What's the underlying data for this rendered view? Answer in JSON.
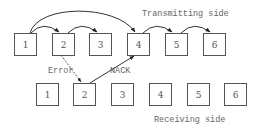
{
  "diagram": {
    "transmitting_label": "Transmitting side",
    "receiving_label": "Receiving side",
    "error_label": "Error",
    "nack_label": "NACK",
    "transmit_packets": [
      "1",
      "2",
      "3",
      "4",
      "5",
      "6"
    ],
    "receive_packets": [
      "1",
      "2",
      "3",
      "4",
      "5",
      "6"
    ],
    "edges": [
      {
        "from": "tx-1",
        "to": "tx-2",
        "style": "solid"
      },
      {
        "from": "tx-2",
        "to": "tx-3",
        "style": "solid"
      },
      {
        "from": "tx-1",
        "to": "tx-4",
        "style": "solid"
      },
      {
        "from": "tx-4",
        "to": "tx-5",
        "style": "solid"
      },
      {
        "from": "tx-5",
        "to": "tx-6",
        "style": "solid"
      },
      {
        "from": "tx-2",
        "to": "rx-2",
        "style": "dashed",
        "label": "Error"
      },
      {
        "from": "rx-2",
        "to": "tx-4",
        "style": "solid",
        "label": "NACK"
      }
    ]
  }
}
